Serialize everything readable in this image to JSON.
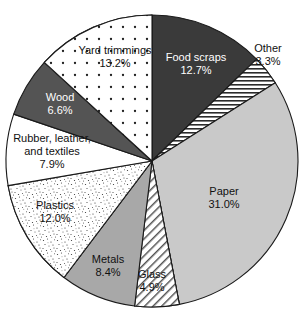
{
  "chart": {
    "type": "pie",
    "title": "",
    "legend_position": "none",
    "start_angle_deg": 0,
    "direction": "clockwise"
  },
  "chart_data": {
    "type": "pie",
    "title": "",
    "subtitle": "",
    "xlabel": "",
    "ylabel": "",
    "grid": false,
    "legend": false,
    "legend_position": "none",
    "categories": [
      "Food scraps",
      "Other",
      "Paper",
      "Glass",
      "Metals",
      "Plastics",
      "Rubber, leather, and textiles",
      "Wood",
      "Yard trimmings"
    ],
    "values": [
      12.7,
      3.3,
      31.0,
      4.9,
      8.4,
      12.0,
      7.9,
      6.6,
      13.2
    ],
    "value_labels": [
      "12.7%",
      "3.3%",
      "31.0%",
      "4.9%",
      "8.4%",
      "12.0%",
      "7.9%",
      "6.6%",
      "13.2%"
    ],
    "units": "percent",
    "total": 100.0,
    "slices": [
      {
        "name": "Food scraps",
        "label_lines": [
          "Food scraps",
          "12.7%"
        ],
        "value": 12.7,
        "value_label": "12.7%",
        "fill": "#3a3a3a",
        "pattern": "solid",
        "text_color": "#ffffff",
        "label_placement": "inside",
        "start_deg": 0.0,
        "end_deg": 45.72,
        "label_x": 196,
        "label_y": 64
      },
      {
        "name": "Other",
        "label_lines": [
          "Other",
          "3.3%"
        ],
        "value": 3.3,
        "value_label": "3.3%",
        "fill": "#ffffff",
        "pattern": "horizontal-hatch",
        "text_color": "#111111",
        "label_placement": "outside",
        "start_deg": 45.72,
        "end_deg": 57.6,
        "label_x": 268,
        "label_y": 55
      },
      {
        "name": "Paper",
        "label_lines": [
          "Paper",
          "31.0%"
        ],
        "value": 31.0,
        "value_label": "31.0%",
        "fill": "#c9c9c9",
        "pattern": "solid",
        "text_color": "#111111",
        "label_placement": "inside",
        "start_deg": 57.6,
        "end_deg": 169.2,
        "label_x": 224,
        "label_y": 198
      },
      {
        "name": "Glass",
        "label_lines": [
          "Glass",
          "4.9%"
        ],
        "value": 4.9,
        "value_label": "4.9%",
        "fill": "#ffffff",
        "pattern": "diagonal-hatch",
        "text_color": "#111111",
        "label_placement": "inside",
        "start_deg": 169.2,
        "end_deg": 186.84,
        "label_x": 152,
        "label_y": 281
      },
      {
        "name": "Metals",
        "label_lines": [
          "Metals",
          "8.4%"
        ],
        "value": 8.4,
        "value_label": "8.4%",
        "fill": "#a8a8a8",
        "pattern": "solid",
        "text_color": "#111111",
        "label_placement": "inside",
        "start_deg": 186.84,
        "end_deg": 217.08,
        "label_x": 108,
        "label_y": 266
      },
      {
        "name": "Plastics",
        "label_lines": [
          "Plastics",
          "12.0%"
        ],
        "value": 12.0,
        "value_label": "12.0%",
        "fill": "#ffffff",
        "pattern": "stipple",
        "text_color": "#111111",
        "label_placement": "inside",
        "start_deg": 217.08,
        "end_deg": 260.28,
        "label_x": 55,
        "label_y": 212
      },
      {
        "name": "Rubber, leather, and textiles",
        "label_lines": [
          "Rubber, leather,",
          "and textiles",
          "7.9%"
        ],
        "value": 7.9,
        "value_label": "7.9%",
        "fill": "#ffffff",
        "pattern": "solid",
        "text_color": "#111111",
        "label_placement": "inside",
        "start_deg": 260.28,
        "end_deg": 288.72,
        "label_x": 52,
        "label_y": 152
      },
      {
        "name": "Wood",
        "label_lines": [
          "Wood",
          "6.6%"
        ],
        "value": 6.6,
        "value_label": "6.6%",
        "fill": "#545454",
        "pattern": "solid",
        "text_color": "#ffffff",
        "label_placement": "inside",
        "start_deg": 288.72,
        "end_deg": 312.48,
        "label_x": 60,
        "label_y": 104
      },
      {
        "name": "Yard trimmings",
        "label_lines": [
          "Yard trimmings",
          "13.2%"
        ],
        "value": 13.2,
        "value_label": "13.2%",
        "fill": "#ffffff",
        "pattern": "dot-grid",
        "text_color": "#111111",
        "label_placement": "inside",
        "start_deg": 312.48,
        "end_deg": 360.0,
        "label_x": 115,
        "label_y": 57
      }
    ],
    "geometry": {
      "center_x": 152,
      "center_y": 161,
      "radius": 146
    },
    "colors": {
      "outline": "#1a1a1a",
      "background": "#ffffff",
      "dark_fill": "#3a3a3a",
      "wood_fill": "#545454",
      "metals_fill": "#a8a8a8",
      "paper_fill": "#c9c9c9"
    }
  }
}
